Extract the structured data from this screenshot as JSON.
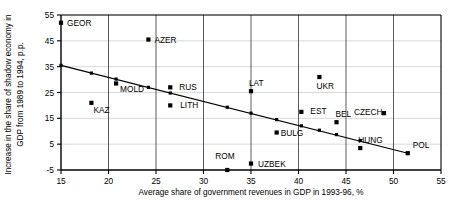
{
  "chart_data": {
    "type": "scatter",
    "title": "",
    "xlabel": "Average share of government revenues in GDP in  1993-96, %",
    "ylabel": "Increase in the share of shadow economy in GDP from 1989 to 1994, p.p.",
    "ylabel_line1": "Increase in the share of shadow economy in",
    "ylabel_line2": "GDP from 1989 to 1994, p.p.",
    "xlim": [
      15,
      55
    ],
    "ylim": [
      -5,
      55
    ],
    "xticks": [
      15,
      20,
      25,
      30,
      35,
      40,
      45,
      50,
      55
    ],
    "yticks": [
      -5,
      5,
      15,
      25,
      35,
      45,
      55
    ],
    "grid": "both",
    "legend": "none",
    "marker_color": "#000000",
    "trendline_color": "#000000",
    "points": [
      {
        "label": "GEOR",
        "x": 15.0,
        "y": 52.0,
        "label_dx": 6,
        "label_dy": 3
      },
      {
        "label": "AZER",
        "x": 24.2,
        "y": 45.5,
        "label_dx": 6,
        "label_dy": 3
      },
      {
        "label": "MOLD",
        "x": 20.8,
        "y": 28.5,
        "label_dx": 4,
        "label_dy": 9
      },
      {
        "label": "KAZ",
        "x": 18.2,
        "y": 21.0,
        "label_dx": 2,
        "label_dy": 10
      },
      {
        "label": "RUS",
        "x": 26.5,
        "y": 27.0,
        "label_dx": 9,
        "label_dy": 3
      },
      {
        "label": "LITH",
        "x": 26.5,
        "y": 20.0,
        "label_dx": 10,
        "label_dy": 3
      },
      {
        "label": "LAT",
        "x": 35.0,
        "y": 25.5,
        "label_dx": -2,
        "label_dy": -5
      },
      {
        "label": "UKR",
        "x": 42.2,
        "y": 31.0,
        "label_dx": -3,
        "label_dy": 12
      },
      {
        "label": "EST",
        "x": 40.3,
        "y": 17.5,
        "label_dx": 9,
        "label_dy": 2
      },
      {
        "label": "CZECH",
        "x": 49.0,
        "y": 17.0,
        "label_dx": -30,
        "label_dy": 2
      },
      {
        "label": "BEL",
        "x": 44.0,
        "y": 13.5,
        "label_dx": -1,
        "label_dy": -5
      },
      {
        "label": "BULG",
        "x": 37.7,
        "y": 9.5,
        "label_dx": 4,
        "label_dy": 3
      },
      {
        "label": "HUNG",
        "x": 46.5,
        "y": 3.5,
        "label_dx": -2,
        "label_dy": -5
      },
      {
        "label": "POL",
        "x": 51.5,
        "y": 1.5,
        "label_dx": 5,
        "label_dy": -5
      },
      {
        "label": "ROM",
        "x": 32.5,
        "y": -5.0,
        "label_dx": -12,
        "label_dy": -11
      },
      {
        "label": "UZBEK",
        "x": 35.0,
        "y": -2.5,
        "label_dx": 7,
        "label_dy": 3
      }
    ],
    "trendline": {
      "x_start": 15.0,
      "y_start": 35.5,
      "x_end": 51.5,
      "y_end": 1.5,
      "fitted_points": [
        {
          "x": 15.0,
          "y": 35.5
        },
        {
          "x": 18.2,
          "y": 32.5
        },
        {
          "x": 20.8,
          "y": 30.2
        },
        {
          "x": 24.2,
          "y": 27.0
        },
        {
          "x": 26.5,
          "y": 24.8
        },
        {
          "x": 32.5,
          "y": 19.3
        },
        {
          "x": 35.0,
          "y": 17.0
        },
        {
          "x": 37.7,
          "y": 14.5
        },
        {
          "x": 40.3,
          "y": 12.1
        },
        {
          "x": 42.2,
          "y": 10.4
        },
        {
          "x": 44.0,
          "y": 8.7
        },
        {
          "x": 46.5,
          "y": 6.4
        },
        {
          "x": 51.5,
          "y": 1.5
        }
      ]
    }
  }
}
